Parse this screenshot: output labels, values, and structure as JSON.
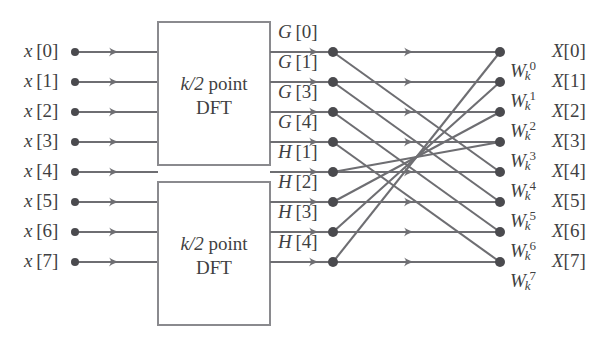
{
  "figure": {
    "stroke_color": "#6e6e72",
    "text_color": "#3f3f42",
    "background": "#ffffff"
  },
  "inputs": [
    {
      "name": "x[0]",
      "var": "x",
      "index": "[0]",
      "row": 0
    },
    {
      "name": "x[1]",
      "var": "x",
      "index": "[1]",
      "row": 1
    },
    {
      "name": "x[2]",
      "var": "x",
      "index": "[2]",
      "row": 2
    },
    {
      "name": "x[3]",
      "var": "x",
      "index": "[3]",
      "row": 3
    },
    {
      "name": "x[4]",
      "var": "x",
      "index": "[4]",
      "row": 4
    },
    {
      "name": "x[5]",
      "var": "x",
      "index": "[5]",
      "row": 5
    },
    {
      "name": "x[6]",
      "var": "x",
      "index": "[6]",
      "row": 6
    },
    {
      "name": "x[7]",
      "var": "x",
      "index": "[7]",
      "row": 7
    }
  ],
  "blocks": [
    {
      "id": "dft-top",
      "line1_math": "k/2",
      "line1_rest": " point",
      "line2": "DFT"
    },
    {
      "id": "dft-bottom",
      "line1_math": "k/2",
      "line1_rest": " point",
      "line2": "DFT"
    }
  ],
  "intermediate": [
    {
      "name": "G[0]",
      "var": "G",
      "index": "[0]",
      "row": 0
    },
    {
      "name": "G[1]",
      "var": "G",
      "index": "[1]",
      "row": 1
    },
    {
      "name": "G[3]",
      "var": "G",
      "index": "[3]",
      "row": 2
    },
    {
      "name": "G[4]",
      "var": "G",
      "index": "[4]",
      "row": 3
    },
    {
      "name": "H[1]",
      "var": "H",
      "index": "[1]",
      "row": 4
    },
    {
      "name": "H[2]",
      "var": "H",
      "index": "[2]",
      "row": 5
    },
    {
      "name": "H[3]",
      "var": "H",
      "index": "[3]",
      "row": 6
    },
    {
      "name": "H[4]",
      "var": "H",
      "index": "[4]",
      "row": 7
    }
  ],
  "twiddles": [
    {
      "name": "W_k^0",
      "base": "W",
      "sub": "k",
      "sup": "0"
    },
    {
      "name": "W_k^1",
      "base": "W",
      "sub": "k",
      "sup": "1"
    },
    {
      "name": "W_k^2",
      "base": "W",
      "sub": "k",
      "sup": "2"
    },
    {
      "name": "W_k^3",
      "base": "W",
      "sub": "k",
      "sup": "3"
    },
    {
      "name": "W_k^4",
      "base": "W",
      "sub": "k",
      "sup": "4"
    },
    {
      "name": "W_k^5",
      "base": "W",
      "sub": "k",
      "sup": "5"
    },
    {
      "name": "W_k^6",
      "base": "W",
      "sub": "k",
      "sup": "6"
    },
    {
      "name": "W_k^7",
      "base": "W",
      "sub": "k",
      "sup": "7"
    }
  ],
  "outputs": [
    {
      "name": "X[0]",
      "var": "X",
      "index": "[0]",
      "row": 0
    },
    {
      "name": "X[1]",
      "var": "X",
      "index": "[1]",
      "row": 1
    },
    {
      "name": "X[2]",
      "var": "X",
      "index": "[2]",
      "row": 2
    },
    {
      "name": "X[3]",
      "var": "X",
      "index": "[3]",
      "row": 3
    },
    {
      "name": "X[4]",
      "var": "X",
      "index": "[4]",
      "row": 4
    },
    {
      "name": "X[5]",
      "var": "X",
      "index": "[5]",
      "row": 5
    },
    {
      "name": "X[6]",
      "var": "X",
      "index": "[6]",
      "row": 6
    },
    {
      "name": "X[7]",
      "var": "X",
      "index": "[7]",
      "row": 7
    }
  ],
  "geometry": {
    "row_y": [
      52,
      82,
      112,
      142,
      172,
      202,
      232,
      262
    ],
    "input_dot_x": 75,
    "input_arrow_x": 120,
    "box_left": 158,
    "box_right": 270,
    "box_top_y1": 22,
    "box_top_y2": 165,
    "box_bot_y1": 182,
    "box_bot_y2": 325,
    "mid_arrow_x": 320,
    "left_node_x": 333,
    "mid_arrow2_x": 415,
    "right_node_x": 500
  },
  "edges": {
    "horizontal_pairs": [
      [
        0,
        0
      ],
      [
        1,
        1
      ],
      [
        2,
        2
      ],
      [
        3,
        3
      ],
      [
        4,
        4
      ],
      [
        5,
        5
      ],
      [
        6,
        6
      ],
      [
        7,
        7
      ]
    ],
    "diagonal_pairs": [
      [
        0,
        4
      ],
      [
        1,
        5
      ],
      [
        2,
        6
      ],
      [
        3,
        7
      ],
      [
        4,
        3
      ],
      [
        5,
        2
      ],
      [
        6,
        1
      ],
      [
        7,
        0
      ]
    ]
  }
}
